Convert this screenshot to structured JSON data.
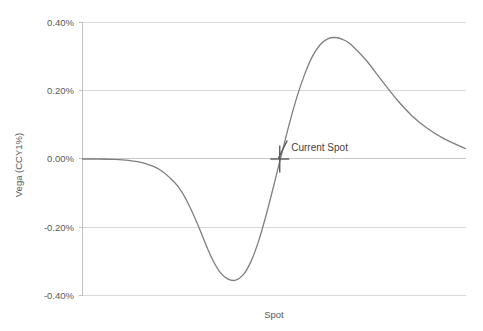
{
  "chart_data": {
    "type": "line",
    "title": "",
    "subtitle": "",
    "xlabel": "Spot",
    "ylabel": "Vega (CCY1%)",
    "ylim": [
      -0.4,
      0.4
    ],
    "ytick_labels": [
      "0.40%",
      "0.20%",
      "0.00%",
      "-0.20%",
      "-0.40%"
    ],
    "ytick_values": [
      0.4,
      0.2,
      0.0,
      -0.2,
      -0.4
    ],
    "xtick_labels": [],
    "grid": "horizontal",
    "legend": "none",
    "series": [
      {
        "name": "Vega",
        "color": "#7f7f7f",
        "x": [
          0.0,
          0.04,
          0.08,
          0.12,
          0.16,
          0.2,
          0.24,
          0.26,
          0.28,
          0.3,
          0.32,
          0.34,
          0.36,
          0.38,
          0.4,
          0.42,
          0.44,
          0.46,
          0.48,
          0.5,
          0.52,
          0.54,
          0.56,
          0.58,
          0.6,
          0.62,
          0.64,
          0.66,
          0.68,
          0.7,
          0.74,
          0.78,
          0.82,
          0.86,
          0.9,
          0.94,
          1.0
        ],
        "y": [
          0.0,
          0.0,
          -0.001,
          -0.004,
          -0.012,
          -0.03,
          -0.068,
          -0.098,
          -0.14,
          -0.19,
          -0.245,
          -0.296,
          -0.333,
          -0.352,
          -0.355,
          -0.339,
          -0.3,
          -0.24,
          -0.162,
          -0.075,
          0.015,
          0.103,
          0.182,
          0.248,
          0.3,
          0.334,
          0.352,
          0.356,
          0.35,
          0.336,
          0.29,
          0.232,
          0.175,
          0.127,
          0.09,
          0.062,
          0.03
        ]
      }
    ],
    "annotations": [
      {
        "id": "current-spot",
        "label": "Current Spot",
        "marker": "plus-cross",
        "x": 0.515,
        "y": 0.0
      }
    ],
    "colors": {
      "series": "#7f7f7f",
      "gridline": "#d9d9d9",
      "axis": "#bfbfbf",
      "text": "#595959",
      "annotation_text": "#3f3f3f",
      "marker": "#5a5a5a",
      "background": "#ffffff"
    }
  }
}
